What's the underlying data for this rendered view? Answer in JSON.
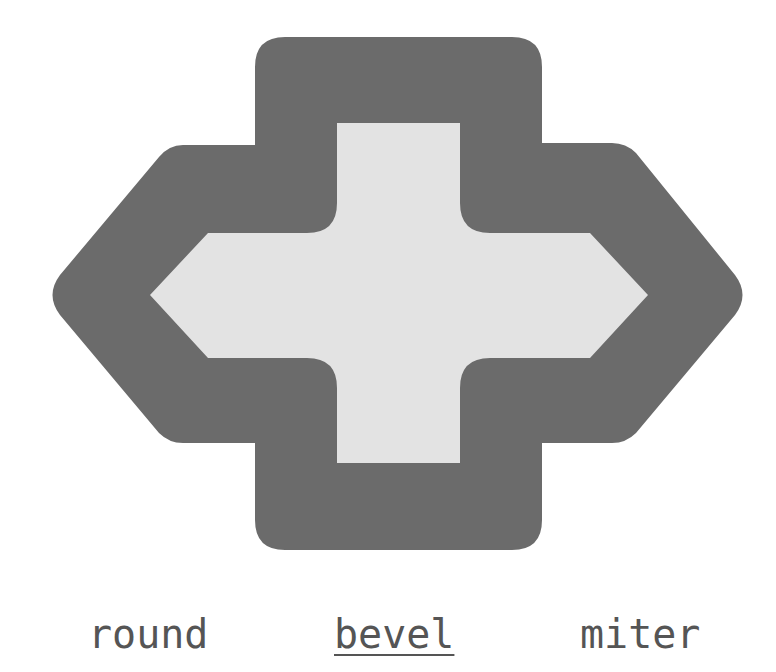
{
  "demo": {
    "title": "lineJoin",
    "colors": {
      "stroke": "#6b6b6b",
      "fill": "#e3e3e3",
      "label": "#555555",
      "background": "#ffffff"
    },
    "shape": {
      "name": "cross-arrow-polygon",
      "outer_bounds": {
        "left": 48,
        "top": 37,
        "right": 746,
        "bottom": 550
      },
      "inner_bounds": {
        "left": 150,
        "top": 123,
        "right": 648,
        "bottom": 463
      }
    }
  },
  "options": [
    {
      "label": "round",
      "selected": false
    },
    {
      "label": "bevel",
      "selected": true
    },
    {
      "label": "miter",
      "selected": false
    }
  ]
}
